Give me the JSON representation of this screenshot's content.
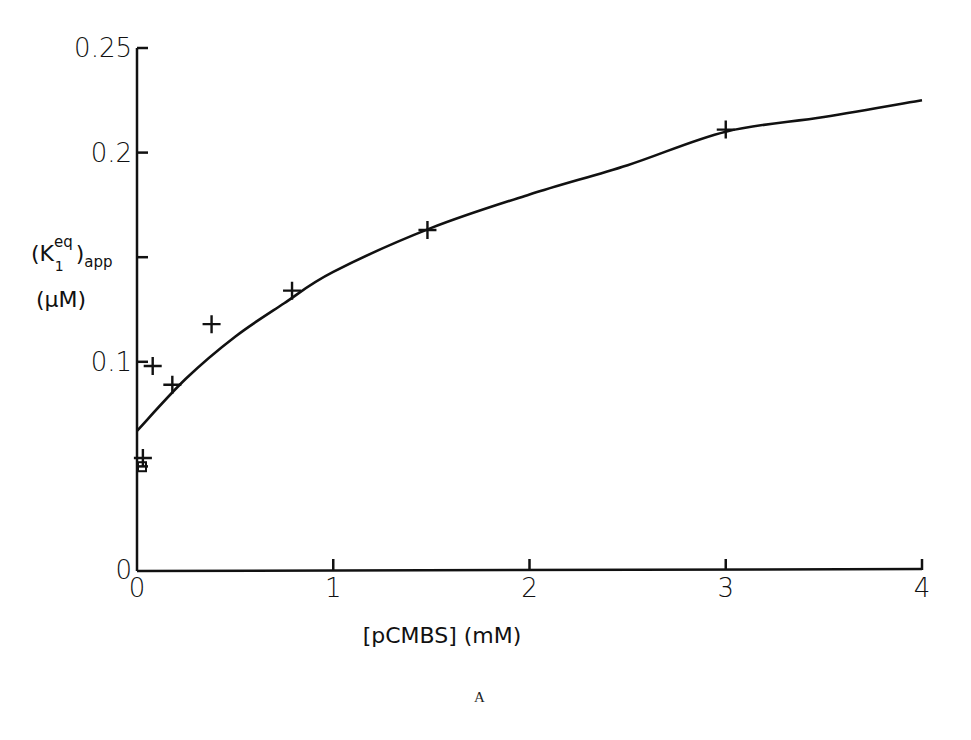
{
  "chart_data": {
    "type": "scatter",
    "title": "",
    "xlabel": "[pCMBS] (mM)",
    "ylabel": "(K1eq)app (µM)",
    "ylabel_parts": {
      "main": "(K",
      "sup": "eq",
      "sub": "1",
      "close": ")",
      "subscript2": "app",
      "unit": "(µM)"
    },
    "xlim": [
      0,
      4
    ],
    "ylim": [
      0,
      0.25
    ],
    "x_ticks": [
      "0",
      "1",
      "2",
      "3",
      "4"
    ],
    "y_ticks": [
      "0",
      "0.1",
      "0.2",
      "0.25"
    ],
    "y_minor_ticks": [
      0.05,
      0.15
    ],
    "grid": false,
    "legend": null,
    "series": [
      {
        "name": "measured",
        "marker": "plus",
        "points": [
          {
            "x": 0.03,
            "y": 0.054
          },
          {
            "x": 0.08,
            "y": 0.098
          },
          {
            "x": 0.18,
            "y": 0.089
          },
          {
            "x": 0.38,
            "y": 0.118
          },
          {
            "x": 0.79,
            "y": 0.134
          },
          {
            "x": 1.48,
            "y": 0.163
          },
          {
            "x": 3.0,
            "y": 0.211
          }
        ]
      },
      {
        "name": "control",
        "marker": "square",
        "points": [
          {
            "x": 0.02,
            "y": 0.052
          }
        ]
      },
      {
        "name": "fitted curve",
        "marker": "none",
        "line": true,
        "points": [
          {
            "x": 0.0,
            "y": 0.067
          },
          {
            "x": 0.25,
            "y": 0.092
          },
          {
            "x": 0.5,
            "y": 0.112
          },
          {
            "x": 0.75,
            "y": 0.128
          },
          {
            "x": 1.0,
            "y": 0.143
          },
          {
            "x": 1.5,
            "y": 0.164
          },
          {
            "x": 2.0,
            "y": 0.18
          },
          {
            "x": 2.5,
            "y": 0.194
          },
          {
            "x": 3.0,
            "y": 0.21
          },
          {
            "x": 3.5,
            "y": 0.217
          },
          {
            "x": 4.0,
            "y": 0.225
          }
        ]
      }
    ],
    "annotations": [
      "A"
    ]
  },
  "caption": "A"
}
